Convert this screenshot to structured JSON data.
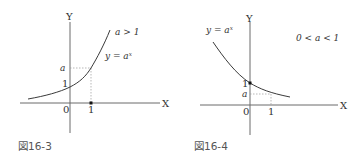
{
  "figures": [
    {
      "caption": "図16-3",
      "condition": "a > 1",
      "curve_label": "y = aˣ",
      "axis_x_label": "X",
      "axis_y_label": "Y",
      "origin_label": "0",
      "x_tick_label": "1",
      "y_tick_one": "1",
      "y_tick_a": "a"
    },
    {
      "caption": "図16-4",
      "condition": "0 < a < 1",
      "curve_label": "y = aˣ",
      "axis_x_label": "X",
      "axis_y_label": "Y",
      "origin_label": "0",
      "x_tick_label": "1",
      "y_tick_one": "1",
      "y_tick_a": "a"
    }
  ]
}
